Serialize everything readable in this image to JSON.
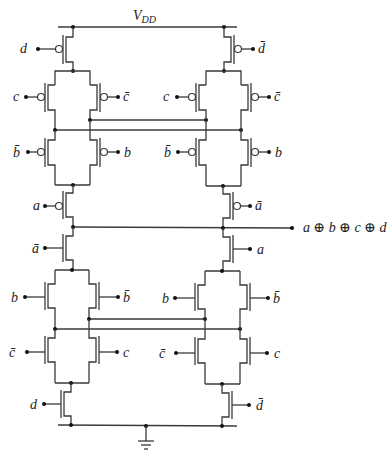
{
  "supply_label": {
    "main": "V",
    "sub": "DD"
  },
  "ground_label": "ground",
  "output_label": "a ⊕ b ⊕ c ⊕ d",
  "pull_up": {
    "left": {
      "top": "d",
      "pair1_left": "c",
      "pair1_right": "c̄",
      "pair2_left": "b̄",
      "pair2_right": "b",
      "bottom": "a"
    },
    "right": {
      "top": "d̄",
      "pair1_left": "c",
      "pair1_right": "c̄",
      "pair2_left": "b̄",
      "pair2_right": "b",
      "bottom": "ā"
    }
  },
  "pull_down": {
    "left": {
      "top": "ā",
      "pair1_left": "b",
      "pair1_right": "b̄",
      "pair2_left": "c̄",
      "pair2_right": "c",
      "bottom": "d"
    },
    "right": {
      "top": "a",
      "pair1_left": "b",
      "pair1_right": "b̄",
      "pair2_left": "c̄",
      "pair2_right": "c",
      "bottom": "d̄"
    }
  },
  "colors": {
    "wire": "#3a3a3a",
    "text": "#222222",
    "background": "#ffffff"
  }
}
